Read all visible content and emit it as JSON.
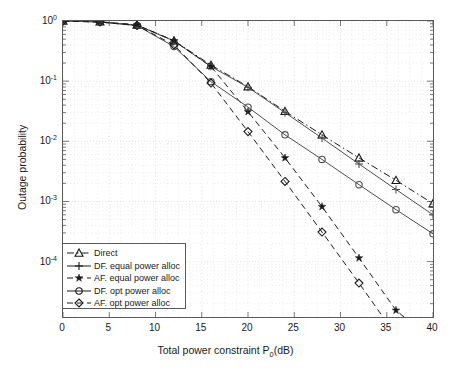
{
  "chart_data": {
    "type": "line",
    "title": "",
    "xlabel": "Total power constraint P_0(dB)",
    "xlabel_main": "Total power constraint P",
    "xlabel_sub": "0",
    "xlabel_tail": "(dB)",
    "ylabel": "Outage probability",
    "xlim": [
      0,
      40
    ],
    "ylim": [
      1.2e-05,
      1.0
    ],
    "yscale": "log",
    "xticks": [
      0,
      5,
      10,
      15,
      20,
      25,
      30,
      35,
      40
    ],
    "xtick_labels": [
      "0",
      "5",
      "10",
      "15",
      "20",
      "25",
      "30",
      "35",
      "40"
    ],
    "yticks": [
      1,
      0.1,
      0.01,
      0.001,
      0.0001
    ],
    "ytick_labels": [
      "10^0",
      "10^-1",
      "10^-2",
      "10^-3",
      "10^-4"
    ],
    "ytick_mantissa": "10",
    "ytick_exponents": [
      "0",
      "-1",
      "-2",
      "-3",
      "-4"
    ],
    "grid": "minor-dotted",
    "grid_color": "#d9d9d9",
    "axis_color": "#5a5a5a",
    "legend_position": "lower left",
    "x": [
      0,
      4,
      8,
      12,
      16,
      20,
      24,
      28,
      32,
      36,
      40
    ],
    "series": [
      {
        "name": "Direct",
        "marker": "triangle",
        "linestyle": "dashdot",
        "color": "#1a1a1a",
        "values": [
          1.0,
          0.97,
          0.86,
          0.47,
          0.185,
          0.081,
          0.0315,
          0.0128,
          0.0053,
          0.00225,
          0.00092
        ]
      },
      {
        "name": "DF. equal power alloc",
        "marker": "plus",
        "linestyle": "solid",
        "color": "#4d4d4d",
        "values": [
          1.0,
          0.97,
          0.85,
          0.465,
          0.175,
          0.079,
          0.03,
          0.0113,
          0.0042,
          0.00158,
          0.0006
        ]
      },
      {
        "name": "AF. equal power alloc",
        "marker": "star",
        "linestyle": "dashed",
        "color": "#1a1a1a",
        "values": [
          1.0,
          0.97,
          0.86,
          0.47,
          0.175,
          0.031,
          0.0053,
          0.00082,
          0.000115,
          1.55e-05,
          2.2e-06
        ]
      },
      {
        "name": "DF. opt power alloc",
        "marker": "circle",
        "linestyle": "solid",
        "color": "#4d4d4d",
        "values": [
          1.0,
          0.96,
          0.84,
          0.375,
          0.098,
          0.037,
          0.0128,
          0.005,
          0.0019,
          0.00073,
          0.00029
        ]
      },
      {
        "name": "AF. opt power alloc",
        "marker": "diamond",
        "linestyle": "dashed",
        "color": "#1a1a1a",
        "values": [
          1.0,
          0.96,
          0.84,
          0.4,
          0.093,
          0.0145,
          0.00215,
          0.00031,
          4.4e-05,
          5.9e-06,
          8e-07
        ]
      }
    ],
    "legend_entries": [
      {
        "label": "Direct",
        "marker": "triangle",
        "linestyle": "dashdot"
      },
      {
        "label": "DF. equal power alloc",
        "marker": "plus",
        "linestyle": "solid"
      },
      {
        "label": "AF. equal power alloc",
        "marker": "star",
        "linestyle": "dashed"
      },
      {
        "label": "DF. opt power alloc",
        "marker": "circle",
        "linestyle": "solid"
      },
      {
        "label": "AF. opt power alloc",
        "marker": "diamond",
        "linestyle": "dashed"
      }
    ]
  }
}
